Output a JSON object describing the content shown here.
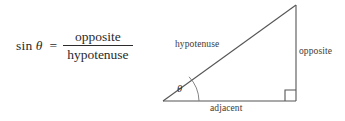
{
  "figure": {
    "type": "trigonometry-diagram",
    "background_color": "#ffffff",
    "line_color": "#555555",
    "text_color": "#2b2b2b"
  },
  "formula": {
    "function_name": "sin",
    "angle_symbol": "θ",
    "equals": "=",
    "numerator": "opposite",
    "denominator": "hypotenuse"
  },
  "diagram": {
    "angle_symbol": "θ",
    "labels": {
      "hypotenuse": "hypotenuse",
      "opposite": "opposite",
      "adjacent": "adjacent"
    },
    "vertices": {
      "left": [
        13,
        101
      ],
      "bottom_right": [
        146,
        101
      ],
      "top_right": [
        146,
        5
      ]
    },
    "right_angle_marker": true,
    "angle_arc": true
  }
}
